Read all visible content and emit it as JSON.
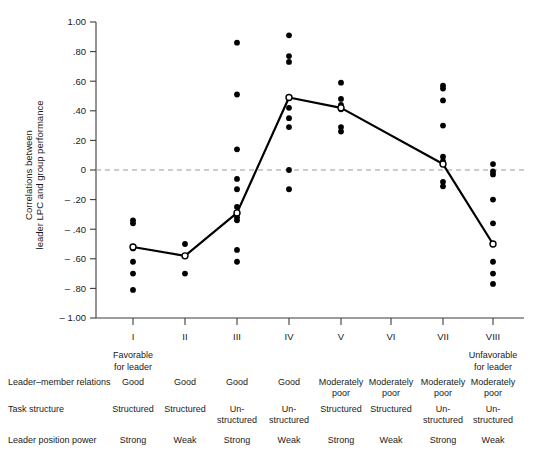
{
  "chart_data": {
    "type": "scatter",
    "title": "",
    "xlabel": "",
    "ylabel": "Correlations between leader LPC and group performance",
    "ylim": [
      -1.0,
      1.0
    ],
    "grid": false,
    "legend": null,
    "y_ticks": [
      "1.00",
      ".80",
      ".60",
      ".40",
      ".20",
      "0",
      "– .20",
      "– .40",
      "– .60",
      "– .80",
      "– 1.00"
    ],
    "y_tick_values": [
      1.0,
      0.8,
      0.6,
      0.4,
      0.2,
      0.0,
      -0.2,
      -0.4,
      -0.6,
      -0.8,
      -1.0
    ],
    "categories": [
      "I",
      "II",
      "III",
      "IV",
      "V",
      "VI",
      "VII",
      "VIII"
    ],
    "x_anchor_low": "Favorable for leader",
    "x_anchor_high": "Unfavorable for leader",
    "zero_reference_line": 0,
    "series": [
      {
        "name": "Study correlations",
        "marker": "filled-circle",
        "points_by_octant": [
          [
            -0.34,
            -0.36,
            -0.52,
            -0.53,
            -0.62,
            -0.7,
            -0.81
          ],
          [
            -0.5,
            -0.58,
            -0.7
          ],
          [
            0.86,
            0.51,
            0.14,
            -0.06,
            -0.13,
            -0.25,
            -0.29,
            -0.32,
            -0.34,
            -0.54,
            -0.62
          ],
          [
            0.91,
            0.77,
            0.73,
            0.49,
            0.42,
            0.35,
            0.29,
            0.0,
            -0.13
          ],
          [
            0.59,
            0.48,
            0.44,
            0.42,
            0.41,
            0.29,
            0.26
          ],
          [],
          [
            0.57,
            0.55,
            0.47,
            0.3,
            0.09,
            0.06,
            0.04,
            -0.08,
            -0.11
          ],
          [
            0.04,
            -0.01,
            -0.03,
            -0.2,
            -0.36,
            -0.5,
            -0.62,
            -0.7,
            -0.77
          ]
        ]
      },
      {
        "name": "Median correlation",
        "marker": "open-circle",
        "values": [
          -0.52,
          -0.58,
          -0.29,
          0.49,
          0.42,
          null,
          0.04,
          -0.5
        ]
      }
    ]
  },
  "table": {
    "rows": [
      {
        "header": "Leader–member relations",
        "cells": [
          "Good",
          "Good",
          "Good",
          "Good",
          "Moderately poor",
          "Moderately poor",
          "Moderately poor",
          "Moderately poor"
        ]
      },
      {
        "header": "Task structure",
        "cells": [
          "Structured",
          "Structured",
          "Un-structured",
          "Un-structured",
          "Structured",
          "Structured",
          "Un-structured",
          "Un-structured"
        ]
      },
      {
        "header": "Leader position power",
        "cells": [
          "Strong",
          "Weak",
          "Strong",
          "Weak",
          "Strong",
          "Weak",
          "Strong",
          "Weak"
        ]
      }
    ]
  },
  "colors": {
    "line": "#000000",
    "point": "#000000",
    "axis": "#3c3c3c",
    "zero_line": "#9a9a9a",
    "background": "#ffffff"
  }
}
